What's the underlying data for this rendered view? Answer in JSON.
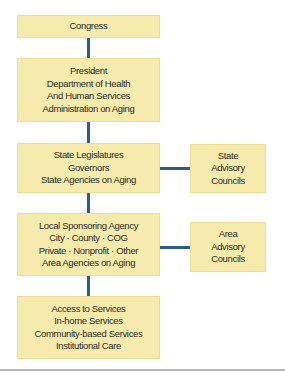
{
  "diagram": {
    "title": "",
    "colors": {
      "box_fill": "#f6ebac",
      "box_border": "#ecdc94",
      "connector": "#2f5a8c",
      "text": "#2b2b2b",
      "rule": "#b5b5b5"
    },
    "nodes": {
      "congress": {
        "lines": [
          "Congress"
        ]
      },
      "federal": {
        "lines": [
          "President",
          "Department of Health",
          "And Human Services",
          "Administration on Aging"
        ]
      },
      "state": {
        "lines": [
          "State Legislatures",
          "Governors",
          "State Agencies on Aging"
        ]
      },
      "state_advisory": {
        "lines": [
          "State",
          "Advisory",
          "Councils"
        ]
      },
      "local": {
        "lines": [
          "Local Sponsoring Agency",
          "City · County · COG",
          "Private · Nonprofit · Other",
          "Area Agencies on Aging"
        ]
      },
      "area_advisory": {
        "lines": [
          "Area",
          "Advisory",
          "Councils"
        ]
      },
      "services": {
        "lines": [
          "Access to Services",
          "In-home Services",
          "Community-based Services",
          "Institutional Care"
        ]
      }
    },
    "edges": [
      {
        "from": "congress",
        "to": "federal",
        "direction": "vertical"
      },
      {
        "from": "federal",
        "to": "state",
        "direction": "vertical"
      },
      {
        "from": "state",
        "to": "state_advisory",
        "direction": "horizontal"
      },
      {
        "from": "state",
        "to": "local",
        "direction": "vertical"
      },
      {
        "from": "local",
        "to": "area_advisory",
        "direction": "horizontal"
      },
      {
        "from": "local",
        "to": "services",
        "direction": "vertical"
      }
    ]
  }
}
